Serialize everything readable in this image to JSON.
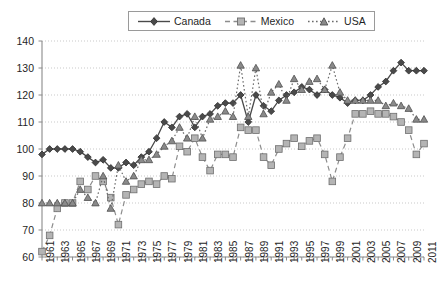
{
  "chart_data": {
    "type": "line",
    "title": "",
    "xlabel": "",
    "ylabel": "",
    "ylim": [
      60,
      140
    ],
    "xlim": [
      1961,
      2011
    ],
    "ytick_step": 10,
    "yticks": [
      60,
      70,
      80,
      90,
      100,
      110,
      120,
      130,
      140
    ],
    "grid": true,
    "grid_style": "dotted-horizontal",
    "legend_position": "top-center",
    "x": [
      1961,
      1962,
      1963,
      1964,
      1965,
      1966,
      1967,
      1968,
      1969,
      1970,
      1971,
      1972,
      1973,
      1974,
      1975,
      1976,
      1977,
      1978,
      1979,
      1980,
      1981,
      1982,
      1983,
      1984,
      1985,
      1986,
      1987,
      1988,
      1989,
      1990,
      1991,
      1992,
      1993,
      1994,
      1995,
      1996,
      1997,
      1998,
      1999,
      2000,
      2001,
      2002,
      2003,
      2004,
      2005,
      2006,
      2007,
      2008,
      2009,
      2010,
      2011
    ],
    "xticklabels": [
      "1961",
      "",
      "1963",
      "",
      "1965",
      "",
      "1967",
      "",
      "1969",
      "",
      "1971",
      "",
      "1973",
      "",
      "1975",
      "",
      "1977",
      "",
      "1979",
      "",
      "1981",
      "",
      "1983",
      "",
      "1985",
      "",
      "1987",
      "",
      "1989",
      "",
      "1991",
      "",
      "1993",
      "",
      "1995",
      "",
      "1997",
      "",
      "1999",
      "",
      "2001",
      "",
      "2003",
      "",
      "2005",
      "",
      "2007",
      "",
      "2009",
      "",
      "2011"
    ],
    "series": [
      {
        "name": "Canada",
        "color": "#4a4a4a",
        "marker": "diamond",
        "linestyle": "solid",
        "values": [
          98,
          100,
          100,
          100,
          100,
          99,
          97,
          95,
          96,
          93,
          93,
          95,
          94,
          97,
          99,
          104,
          110,
          108,
          112,
          113,
          108,
          112,
          113,
          116,
          117,
          117,
          120,
          110,
          120,
          116,
          114,
          118,
          120,
          121,
          123,
          122,
          120,
          122,
          120,
          119,
          117,
          118,
          118,
          120,
          123,
          125,
          129,
          132,
          129,
          129,
          129
        ]
      },
      {
        "name": "Mexico",
        "color": "#b4b4b4",
        "marker": "square",
        "linestyle": "dashed",
        "values": [
          62,
          68,
          78,
          80,
          80,
          88,
          85,
          90,
          88,
          82,
          72,
          83,
          85,
          87,
          88,
          87,
          90,
          89,
          101,
          99,
          104,
          97,
          92,
          98,
          98,
          97,
          108,
          107,
          107,
          97,
          94,
          100,
          102,
          104,
          101,
          103,
          104,
          98,
          88,
          97,
          104,
          113,
          113,
          114,
          113,
          113,
          112,
          110,
          107,
          98,
          102
        ]
      },
      {
        "name": "USA",
        "color": "#777777",
        "marker": "triangle",
        "linestyle": "dotted",
        "values": [
          80,
          80,
          80,
          80,
          80,
          85,
          82,
          80,
          90,
          78,
          94,
          88,
          90,
          96,
          96,
          98,
          101,
          103,
          108,
          104,
          112,
          104,
          111,
          112,
          114,
          112,
          131,
          112,
          130,
          113,
          121,
          124,
          118,
          126,
          122,
          125,
          126,
          122,
          131,
          121,
          118,
          118,
          118,
          118,
          118,
          116,
          117,
          116,
          115,
          111,
          111
        ]
      }
    ]
  }
}
